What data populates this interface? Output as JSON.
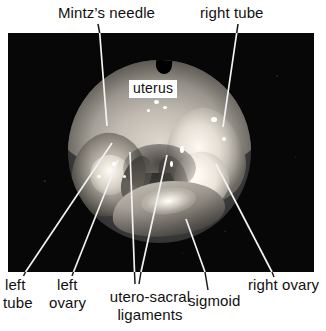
{
  "figure": {
    "type": "annotated-laparoscopy-photograph",
    "modality": "laparoscopy",
    "view": "pelvic cavity, circular endoscopic field of view",
    "background_color": "#ffffff",
    "plate_color": "#070707"
  },
  "labels": {
    "mintz_needle": "Mintz’s needle",
    "right_tube": "right tube",
    "uterus": "uterus",
    "left_tube_line1": "left",
    "left_tube_line2": "tube",
    "left_ovary_line1": "left",
    "left_ovary_line2": "ovary",
    "utero_sacral_line1": "utero-sacral",
    "utero_sacral_line2": "ligaments",
    "sigmoid": "sigmoid",
    "right_ovary": "right ovary"
  },
  "annotations": [
    {
      "name": "mintz-needle",
      "label": "Mintz’s needle",
      "position": "top-left",
      "leader_from": [
        98,
        24
      ],
      "leader_to": [
        107,
        126
      ]
    },
    {
      "name": "right-tube",
      "label": "right tube",
      "position": "top-right",
      "leader_from": [
        238,
        24
      ],
      "leader_to": [
        223,
        127
      ]
    },
    {
      "name": "uterus",
      "label": "uterus",
      "position": "center-top",
      "style": "white boxed caption over tissue",
      "leader_from": null,
      "leader_to": null
    },
    {
      "name": "left-tube",
      "label": "left tube",
      "position": "bottom-left",
      "leader_from": [
        112,
        143
      ],
      "leader_to": [
        22,
        272
      ]
    },
    {
      "name": "left-ovary",
      "label": "left ovary",
      "position": "bottom-left",
      "leader_from": [
        118,
        160
      ],
      "leader_to": [
        72,
        272
      ]
    },
    {
      "name": "utero-sacral-ligaments",
      "label": "utero-sacral ligaments",
      "position": "bottom-center",
      "leader_from": [
        130,
        152
      ],
      "leader_to": [
        134,
        272
      ],
      "second_leader_from": [
        167,
        155
      ],
      "second_leader_to": [
        140,
        272
      ]
    },
    {
      "name": "sigmoid",
      "label": "sigmoid",
      "position": "bottom-center-right",
      "leader_from": [
        186,
        219
      ],
      "leader_to": [
        206,
        272
      ]
    },
    {
      "name": "right-ovary",
      "label": "right ovary",
      "position": "bottom-right",
      "leader_from": [
        216,
        164
      ],
      "leader_to": [
        273,
        272
      ]
    }
  ],
  "colors": {
    "text": "#111111",
    "page": "#ffffff",
    "plate": "#070707",
    "leader_line": "#f2f2f2",
    "leader_line_outside": "#1a1a1a"
  }
}
